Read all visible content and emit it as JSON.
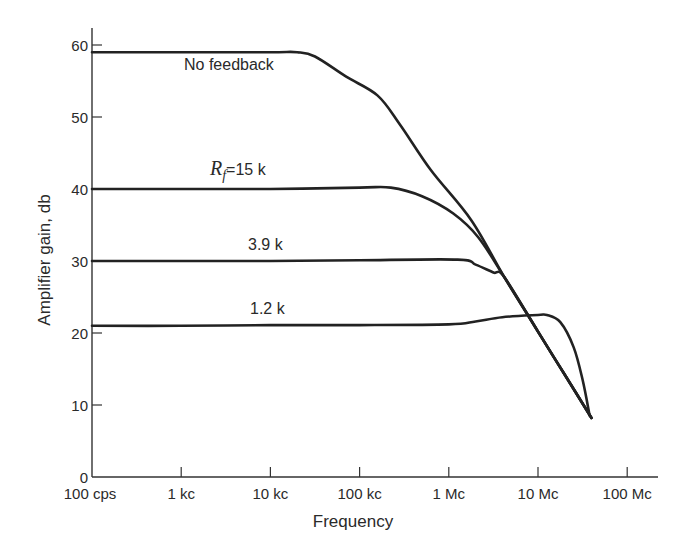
{
  "chart_data": {
    "type": "line",
    "title": "",
    "xlabel": "Frequency",
    "ylabel": "Amplifier gain, db",
    "xscale": "log",
    "x_unit": "Hz (cps)",
    "xlim_hz": [
      100,
      300000000
    ],
    "ylim": [
      0,
      62
    ],
    "grid": false,
    "legend": "none (inline curve labels)",
    "x_ticks": [
      {
        "value_hz": 100,
        "label": "100 cps"
      },
      {
        "value_hz": 1000,
        "label": "1 kc"
      },
      {
        "value_hz": 10000,
        "label": "10 kc"
      },
      {
        "value_hz": 100000,
        "label": "100 kc"
      },
      {
        "value_hz": 1000000,
        "label": "1 Mc"
      },
      {
        "value_hz": 10000000,
        "label": "10 Mc"
      },
      {
        "value_hz": 100000000,
        "label": "100 Mc"
      }
    ],
    "y_ticks": [
      {
        "value": 0,
        "label": "0"
      },
      {
        "value": 10,
        "label": "10"
      },
      {
        "value": 20,
        "label": "20"
      },
      {
        "value": 30,
        "label": "30"
      },
      {
        "value": 40,
        "label": "40"
      },
      {
        "value": 50,
        "label": "50"
      },
      {
        "value": 60,
        "label": "60"
      }
    ],
    "series": [
      {
        "name": "No feedback",
        "label": "No feedback",
        "points_log10hz_db": [
          [
            2.0,
            59.0
          ],
          [
            3.0,
            59.0
          ],
          [
            4.0,
            59.0
          ],
          [
            4.3,
            59.0
          ],
          [
            4.5,
            58.4
          ],
          [
            4.85,
            55.6
          ],
          [
            5.2,
            53.0
          ],
          [
            5.45,
            49.0
          ],
          [
            5.8,
            42.6
          ],
          [
            6.25,
            35.7
          ],
          [
            6.62,
            27.8
          ],
          [
            7.0,
            20.2
          ],
          [
            7.3,
            14.2
          ],
          [
            7.6,
            8.2
          ]
        ]
      },
      {
        "name": "Rf = 15 k",
        "label_main": "R",
        "label_sub": "f",
        "label_rest": "=15 k",
        "points_log10hz_db": [
          [
            2.0,
            40.0
          ],
          [
            3.0,
            40.0
          ],
          [
            4.0,
            40.0
          ],
          [
            5.0,
            40.2
          ],
          [
            5.35,
            40.2
          ],
          [
            5.7,
            39.0
          ],
          [
            6.05,
            36.6
          ],
          [
            6.33,
            33.3
          ],
          [
            6.62,
            27.8
          ],
          [
            7.0,
            20.2
          ],
          [
            7.3,
            14.2
          ],
          [
            7.6,
            8.2
          ]
        ]
      },
      {
        "name": "3.9 k",
        "label": "3.9 k",
        "points_log10hz_db": [
          [
            2.0,
            30.0
          ],
          [
            3.0,
            30.0
          ],
          [
            4.0,
            30.0
          ],
          [
            5.0,
            30.1
          ],
          [
            6.1,
            30.2
          ],
          [
            6.3,
            29.5
          ],
          [
            6.5,
            28.4
          ],
          [
            6.62,
            27.8
          ],
          [
            7.0,
            20.2
          ],
          [
            7.3,
            14.2
          ],
          [
            7.6,
            8.2
          ]
        ]
      },
      {
        "name": "1.2 k",
        "label": "1.2 k",
        "points_log10hz_db": [
          [
            2.0,
            21.0
          ],
          [
            3.0,
            21.0
          ],
          [
            4.0,
            21.1
          ],
          [
            5.0,
            21.1
          ],
          [
            6.0,
            21.2
          ],
          [
            6.3,
            21.6
          ],
          [
            6.6,
            22.2
          ],
          [
            7.0,
            22.5
          ],
          [
            7.1,
            22.5
          ],
          [
            7.25,
            21.5
          ],
          [
            7.4,
            18.0
          ],
          [
            7.5,
            13.5
          ],
          [
            7.58,
            8.5
          ]
        ]
      }
    ]
  },
  "labels": {
    "no_feedback": "No feedback",
    "rf_main": "R",
    "rf_sub": "f",
    "rf_rest": "=15 k",
    "k39": "3.9 k",
    "k12": "1.2 k",
    "xlabel": "Frequency",
    "ylabel": "Amplifier gain, db"
  }
}
